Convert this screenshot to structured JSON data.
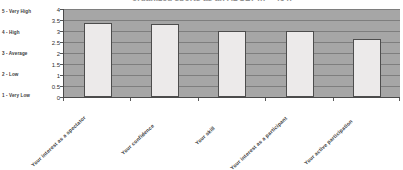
{
  "chart_data": {
    "type": "bar",
    "title": "organized sports as an ADULT (n = 464)",
    "xlabel": "",
    "ylabel": "",
    "categories": [
      "Your interest as a spectator",
      "Your confidence",
      "Your skill",
      "Your interest as a participant",
      "Your active participation"
    ],
    "values": [
      3.35,
      3.3,
      3.0,
      3.0,
      2.65
    ],
    "ylim": [
      0,
      4
    ],
    "yticks": [
      "0",
      "0.5",
      "1",
      "1.5",
      "2",
      "2.5",
      "3",
      "3.5",
      "4"
    ],
    "ytick_values": [
      0,
      0.5,
      1,
      1.5,
      2,
      2.5,
      3,
      3.5,
      4
    ],
    "grid": true,
    "legend_position": "none",
    "scale_legend": [
      "5 - Very High",
      "4 - High",
      "3 - Average",
      "2 - Low",
      "1 - Very Low"
    ],
    "colors": {
      "plot_background": "#a6a6a6",
      "bar_fill": "#eceaea",
      "bar_border": "#4d4d4d",
      "gridline": "#7e7e7e",
      "axis": "#4a4a4a",
      "text": "#3a3a3a",
      "page_background": "#ffffff"
    }
  }
}
